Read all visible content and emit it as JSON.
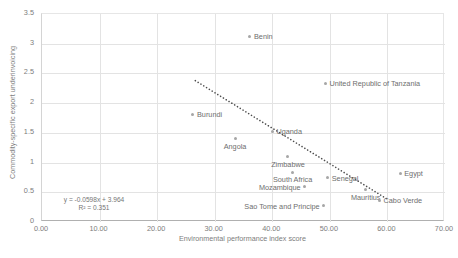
{
  "chart_data": {
    "type": "scatter",
    "title": "",
    "xlabel": "Environmental performance index score",
    "ylabel": "Commodity-specific export underinvoicing",
    "xlim": [
      0,
      70
    ],
    "ylim": [
      0,
      3.5
    ],
    "xticks": [
      "0.00",
      "10.00",
      "20.00",
      "30.00",
      "40.00",
      "50.00",
      "60.00",
      "70.00"
    ],
    "xtick_values": [
      0,
      10,
      20,
      30,
      40,
      50,
      60,
      70
    ],
    "yticks": [
      "0",
      "0.5",
      "1",
      "1.5",
      "2",
      "2.5",
      "3",
      "3.5"
    ],
    "ytick_values": [
      0,
      0.5,
      1,
      1.5,
      2,
      2.5,
      3,
      3.5
    ],
    "grid": true,
    "legend": "none",
    "marker_color": "#a6a6a6",
    "trendline_color": "#4d4d4d",
    "points": [
      {
        "label": "Benin",
        "x": 36.3,
        "y": 3.11,
        "pos": "right"
      },
      {
        "label": "United Republic of Tanzania",
        "x": 49.4,
        "y": 2.32,
        "pos": "right"
      },
      {
        "label": "Burundi",
        "x": 26.4,
        "y": 1.8,
        "pos": "right"
      },
      {
        "label": "Uganda",
        "x": 40.2,
        "y": 1.51,
        "pos": "right"
      },
      {
        "label": "Angola",
        "x": 33.7,
        "y": 1.38,
        "pos": "below"
      },
      {
        "label": "Zimbabwe",
        "x": 42.9,
        "y": 1.08,
        "pos": "below"
      },
      {
        "label": "South Africa",
        "x": 43.7,
        "y": 0.82,
        "pos": "below"
      },
      {
        "label": "Egypt",
        "x": 62.4,
        "y": 0.8,
        "pos": "right"
      },
      {
        "label": "Senegal",
        "x": 49.8,
        "y": 0.73,
        "pos": "right"
      },
      {
        "label": "Mozambique",
        "x": 45.8,
        "y": 0.58,
        "pos": "left"
      },
      {
        "label": "Mauritius",
        "x": 56.4,
        "y": 0.53,
        "pos": "below"
      },
      {
        "label": "Cabo Verde",
        "x": 58.8,
        "y": 0.35,
        "pos": "right"
      },
      {
        "label": "Sao Tome and Principe",
        "x": 49.1,
        "y": 0.26,
        "pos": "left"
      }
    ],
    "trendline": {
      "equation": "y = -0.0598x + 3.964",
      "r_squared_label": "R² = 0.351",
      "slope": -0.0598,
      "intercept": 3.964,
      "r_squared": 0.351,
      "x_start": 26.8,
      "x_end": 60.0,
      "style": "dotted"
    }
  }
}
